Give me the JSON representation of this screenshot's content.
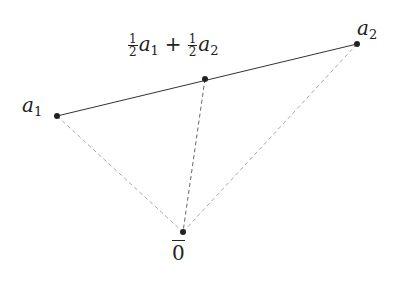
{
  "diagram": {
    "points": {
      "a1": {
        "x": 57,
        "y": 116,
        "label_var": "a",
        "label_sub": "1"
      },
      "a2": {
        "x": 357,
        "y": 44,
        "label_var": "a",
        "label_sub": "2"
      },
      "mid": {
        "x": 205,
        "y": 79
      },
      "origin": {
        "x": 183,
        "y": 232,
        "label": "0"
      }
    },
    "midpoint_label": {
      "coef1_num": "1",
      "coef1_den": "2",
      "var1": "a",
      "sub1": "1",
      "operator": "+",
      "coef2_num": "1",
      "coef2_den": "2",
      "var2": "a",
      "sub2": "2"
    },
    "colors": {
      "solid_line": "#333333",
      "dashed_outer": "#aaaaaa",
      "dashed_mid": "#666666",
      "point": "#222222"
    }
  }
}
